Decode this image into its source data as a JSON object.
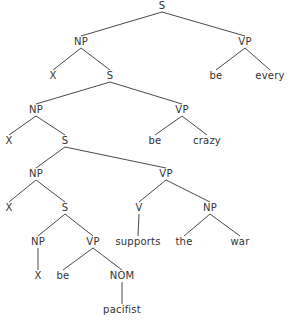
{
  "diagram": {
    "type": "syntax-tree",
    "colors": {
      "line": "#4a4a4a",
      "text": "#333333",
      "background": "#ffffff"
    },
    "nodes": [
      {
        "id": "s0",
        "label": "S",
        "x": 162,
        "y": 6
      },
      {
        "id": "np1",
        "label": "NP",
        "x": 81,
        "y": 42
      },
      {
        "id": "vp1",
        "label": "VP",
        "x": 245,
        "y": 42
      },
      {
        "id": "x1",
        "label": "X",
        "x": 53,
        "y": 76
      },
      {
        "id": "s1",
        "label": "S",
        "x": 110,
        "y": 76
      },
      {
        "id": "be1",
        "label": "be",
        "x": 216,
        "y": 76
      },
      {
        "id": "every",
        "label": "every",
        "x": 270,
        "y": 76
      },
      {
        "id": "np2",
        "label": "NP",
        "x": 36,
        "y": 110
      },
      {
        "id": "vp2",
        "label": "VP",
        "x": 182,
        "y": 110
      },
      {
        "id": "x2",
        "label": "X",
        "x": 9,
        "y": 141
      },
      {
        "id": "s2",
        "label": "S",
        "x": 65,
        "y": 141
      },
      {
        "id": "be2",
        "label": "be",
        "x": 155,
        "y": 141
      },
      {
        "id": "crazy",
        "label": "crazy",
        "x": 207,
        "y": 141
      },
      {
        "id": "np3",
        "label": "NP",
        "x": 36,
        "y": 174
      },
      {
        "id": "vp3",
        "label": "VP",
        "x": 166,
        "y": 174
      },
      {
        "id": "x3",
        "label": "X",
        "x": 9,
        "y": 208
      },
      {
        "id": "s3",
        "label": "S",
        "x": 65,
        "y": 208
      },
      {
        "id": "v",
        "label": "V",
        "x": 139,
        "y": 208
      },
      {
        "id": "np4",
        "label": "NP",
        "x": 210,
        "y": 208
      },
      {
        "id": "np5",
        "label": "NP",
        "x": 38,
        "y": 242
      },
      {
        "id": "vp4",
        "label": "VP",
        "x": 93,
        "y": 242
      },
      {
        "id": "supports",
        "label": "supports",
        "x": 138,
        "y": 242
      },
      {
        "id": "the",
        "label": "the",
        "x": 184,
        "y": 242
      },
      {
        "id": "war",
        "label": "war",
        "x": 240,
        "y": 242
      },
      {
        "id": "x4",
        "label": "X",
        "x": 38,
        "y": 276
      },
      {
        "id": "be3",
        "label": "be",
        "x": 63,
        "y": 276
      },
      {
        "id": "nom",
        "label": "NOM",
        "x": 122,
        "y": 276
      },
      {
        "id": "pacifist",
        "label": "pacifist",
        "x": 122,
        "y": 310
      }
    ],
    "edges": [
      [
        "s0",
        "np1"
      ],
      [
        "s0",
        "vp1"
      ],
      [
        "np1",
        "x1"
      ],
      [
        "np1",
        "s1"
      ],
      [
        "vp1",
        "be1"
      ],
      [
        "vp1",
        "every"
      ],
      [
        "s1",
        "np2"
      ],
      [
        "s1",
        "vp2"
      ],
      [
        "np2",
        "x2"
      ],
      [
        "np2",
        "s2"
      ],
      [
        "vp2",
        "be2"
      ],
      [
        "vp2",
        "crazy"
      ],
      [
        "s2",
        "np3"
      ],
      [
        "s2",
        "vp3"
      ],
      [
        "np3",
        "x3"
      ],
      [
        "np3",
        "s3"
      ],
      [
        "vp3",
        "v"
      ],
      [
        "vp3",
        "np4"
      ],
      [
        "s3",
        "np5"
      ],
      [
        "s3",
        "vp4"
      ],
      [
        "v",
        "supports"
      ],
      [
        "np4",
        "the"
      ],
      [
        "np4",
        "war"
      ],
      [
        "np5",
        "x4"
      ],
      [
        "vp4",
        "be3"
      ],
      [
        "vp4",
        "nom"
      ],
      [
        "nom",
        "pacifist"
      ]
    ]
  }
}
